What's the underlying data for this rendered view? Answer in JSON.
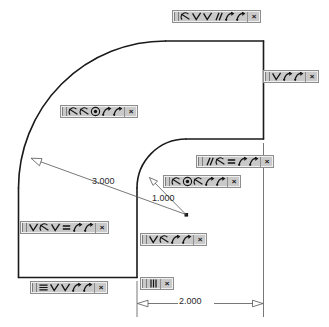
{
  "app": {
    "view": "sketch-canvas",
    "background": "#ffffff",
    "geometry_color": "#1a1a1a",
    "dimension_color": "#4a4a4a",
    "toolbar_face": "#c9c9c9",
    "toolbar_border": "#8e8e8e"
  },
  "dimensions": [
    {
      "id": "outer-radius",
      "value": "3.000",
      "type": "radial",
      "x": 92,
      "y": 176
    },
    {
      "id": "inner-radius",
      "value": "1.000",
      "type": "radial",
      "x": 152,
      "y": 193
    },
    {
      "id": "width",
      "value": "2.000",
      "type": "linear-horizontal",
      "x": 186,
      "y": 300
    }
  ],
  "close_label": "×",
  "toolbars": [
    {
      "id": "top-edge-relations",
      "x": 172,
      "y": 10,
      "icons": [
        "tangent-icon",
        "perpendicular-icon",
        "perpendicular-icon",
        "parallel-icon",
        "coincident-icon",
        "coincident-icon"
      ]
    },
    {
      "id": "right-edge-relations",
      "x": 263,
      "y": 70,
      "icons": [
        "perpendicular-icon",
        "coincident-icon",
        "coincident-icon"
      ]
    },
    {
      "id": "outer-arc-relations",
      "x": 60,
      "y": 105,
      "icons": [
        "tangent-icon",
        "tangent-icon",
        "concentric-icon",
        "coincident-icon",
        "coincident-icon"
      ]
    },
    {
      "id": "inner-top-edge-relations",
      "x": 196,
      "y": 155,
      "icons": [
        "parallel-icon",
        "tangent-icon",
        "equal-icon",
        "coincident-icon",
        "coincident-icon"
      ]
    },
    {
      "id": "inner-arc-relations",
      "x": 163,
      "y": 175,
      "icons": [
        "tangent-icon",
        "concentric-icon",
        "tangent-icon",
        "coincident-icon",
        "coincident-icon"
      ]
    },
    {
      "id": "left-edge-relations",
      "x": 20,
      "y": 221,
      "icons": [
        "perpendicular-icon",
        "tangent-icon",
        "perpendicular-icon",
        "equal-icon",
        "coincident-icon",
        "coincident-icon"
      ]
    },
    {
      "id": "inner-vertical-edge-relations",
      "x": 140,
      "y": 233,
      "icons": [
        "perpendicular-icon",
        "tangent-icon",
        "coincident-icon",
        "coincident-icon"
      ]
    },
    {
      "id": "center-point-relation",
      "x": 140,
      "y": 277,
      "icons": [
        "vertical-icon"
      ]
    },
    {
      "id": "bottom-edge-relations",
      "x": 30,
      "y": 281,
      "icons": [
        "horizontal-icon",
        "perpendicular-icon",
        "perpendicular-icon",
        "coincident-icon",
        "coincident-icon"
      ]
    }
  ]
}
